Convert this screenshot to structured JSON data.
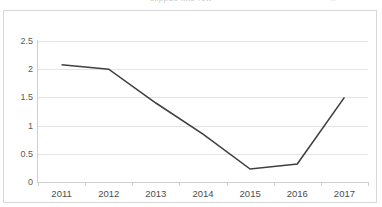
{
  "title_strip": {
    "cut_text": "clipped title row",
    "cut_right": "..."
  },
  "colors": {
    "line": "#404040",
    "gridline": "#e4e4e4",
    "axis": "#d0d0d0",
    "frame": "#d8d8d8",
    "tick_text": "#4d4d4d",
    "background": "#ffffff"
  },
  "chart_data": {
    "type": "line",
    "title": "",
    "xlabel": "",
    "ylabel": "",
    "categories": [
      "2011",
      "2012",
      "2013",
      "2014",
      "2015",
      "2016",
      "2017"
    ],
    "values": [
      2.08,
      2.0,
      1.4,
      0.85,
      0.23,
      0.32,
      1.5
    ],
    "series": [
      {
        "name": "series-1",
        "values": [
          2.08,
          2.0,
          1.4,
          0.85,
          0.23,
          0.32,
          1.5
        ],
        "color": "#404040",
        "markers": false,
        "line_width": 1.6
      }
    ],
    "ylim": [
      0,
      2.5
    ],
    "ytick_values": [
      0,
      0.5,
      1,
      1.5,
      2,
      2.5
    ],
    "ytick_labels": [
      "0",
      "0.5",
      "1",
      "1.5",
      "2",
      "2.5"
    ],
    "grid": true,
    "grid_axis": "y",
    "legend": false,
    "legend_position": "none"
  }
}
